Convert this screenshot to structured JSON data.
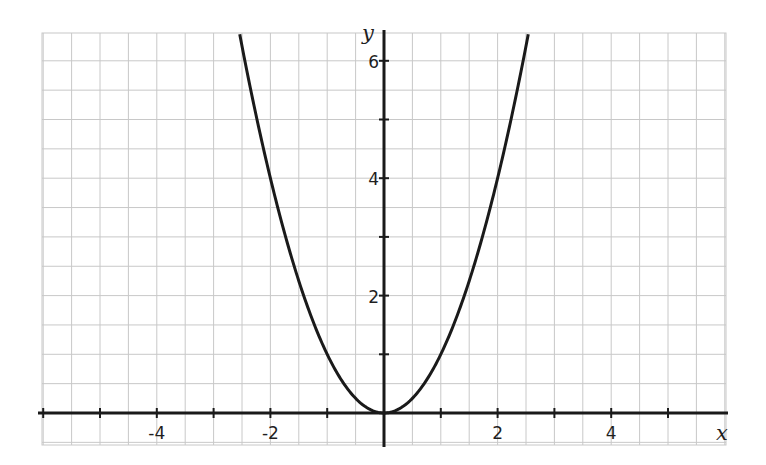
{
  "chart_data": {
    "type": "line",
    "title": "",
    "function": "y = x^2",
    "xlabel": "x",
    "ylabel": "y",
    "xlim": [
      -6.1,
      6.1
    ],
    "ylim": [
      -0.55,
      6.5
    ],
    "grid": true,
    "grid_step_x": 0.5,
    "grid_step_y": 0.5,
    "x_ticks": [
      -6,
      -5,
      -4,
      -3,
      -2,
      -1,
      1,
      2,
      3,
      4,
      5
    ],
    "x_tick_labels": [
      {
        "value": -4,
        "label": "-4"
      },
      {
        "value": -2,
        "label": "-2"
      },
      {
        "value": 2,
        "label": "2"
      },
      {
        "value": 4,
        "label": "4"
      }
    ],
    "y_ticks": [
      1,
      2,
      3,
      4,
      5,
      6
    ],
    "y_tick_labels": [
      {
        "value": 2,
        "label": "2"
      },
      {
        "value": 4,
        "label": "4"
      },
      {
        "value": 6,
        "label": "6"
      }
    ],
    "series": [
      {
        "name": "y = x^2",
        "x": [
          -2.54,
          -2.5,
          -2,
          -1.5,
          -1,
          -0.5,
          0,
          0.5,
          1,
          1.5,
          2,
          2.5,
          2.54
        ],
        "y": [
          6.45,
          6.25,
          4,
          2.25,
          1,
          0.25,
          0,
          0.25,
          1,
          2.25,
          4,
          6.25,
          6.45
        ]
      }
    ],
    "legend": null
  },
  "colors": {
    "grid": "#c8c8c8",
    "axis": "#1a1a1a",
    "curve": "#1a1a1a",
    "background": "#ffffff"
  }
}
